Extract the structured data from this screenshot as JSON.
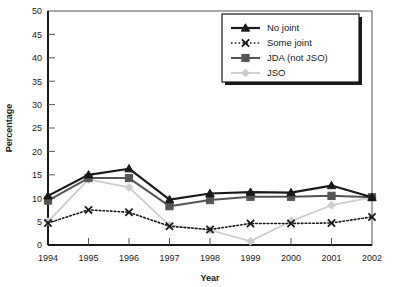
{
  "chart_data": {
    "type": "line",
    "title": "",
    "xlabel": "Year",
    "ylabel": "Percentage",
    "categories": [
      "1994",
      "1995",
      "1996",
      "1997",
      "1998",
      "1999",
      "2000",
      "2001",
      "2002"
    ],
    "x": [
      1994,
      1995,
      1996,
      1997,
      1998,
      1999,
      2000,
      2001,
      2002
    ],
    "xlim": [
      1994,
      2002
    ],
    "ylim": [
      0,
      50
    ],
    "yticks": [
      0,
      5,
      10,
      15,
      20,
      25,
      30,
      35,
      40,
      45,
      50
    ],
    "grid": false,
    "legend_position": "top-right",
    "series": [
      {
        "name": "No joint",
        "color": "#1a1a1a",
        "marker": "triangle",
        "line_style": "solid",
        "line_width": 2.2,
        "values": [
          10.5,
          15.0,
          16.3,
          9.7,
          11.0,
          11.3,
          11.2,
          12.7,
          10.2
        ]
      },
      {
        "name": "Some joint",
        "color": "#1a1a1a",
        "marker": "x",
        "line_style": "dotted",
        "line_width": 1.6,
        "values": [
          4.7,
          7.5,
          7.0,
          4.0,
          3.3,
          4.6,
          4.6,
          4.7,
          6.0
        ]
      },
      {
        "name": "JDA (not JSO)",
        "color": "#555555",
        "marker": "square",
        "line_style": "solid",
        "line_width": 2.0,
        "values": [
          9.5,
          14.3,
          14.3,
          8.3,
          9.6,
          10.3,
          10.3,
          10.5,
          10.2
        ]
      },
      {
        "name": "JSO",
        "color": "#cccccc",
        "marker": "diamond",
        "line_style": "solid",
        "line_width": 1.8,
        "values": [
          5.0,
          14.0,
          12.3,
          4.2,
          3.2,
          0.8,
          5.1,
          8.5,
          10.2
        ]
      }
    ]
  },
  "axes": {
    "y_label": "Percentage",
    "x_label": "Year",
    "y_ticks": [
      "0",
      "5",
      "10",
      "15",
      "20",
      "25",
      "30",
      "35",
      "40",
      "45",
      "50"
    ],
    "x_ticks": [
      "1994",
      "1995",
      "1996",
      "1997",
      "1998",
      "1999",
      "2000",
      "2001",
      "2002"
    ]
  },
  "legend": {
    "items": [
      {
        "label": "No joint"
      },
      {
        "label": "Some joint"
      },
      {
        "label": "JDA (not JSO)"
      },
      {
        "label": "JSO"
      }
    ]
  }
}
